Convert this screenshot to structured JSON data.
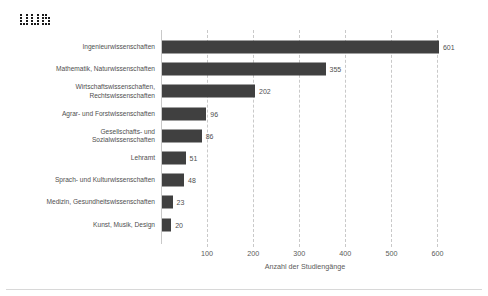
{
  "logo": {
    "name": "dot-matrix-logo",
    "alt": "uu"
  },
  "chart_data": {
    "type": "bar",
    "orientation": "horizontal",
    "title": "",
    "xlabel": "Anzahl der Studiengänge",
    "ylabel": "",
    "categories": [
      "Ingenieurwissenschaften",
      "Mathematik, Naturwissenschaften",
      "Wirtschaftswissenschaften,\nRechtswissenschaften",
      "Agrar- und Forstwissenschaften",
      "Gesellschafts- und\nSozialwissenschaften",
      "Lehramt",
      "Sprach- und Kulturwissenschaften",
      "Medizin, Gesundheitswissenschaften",
      "Kunst, Musik, Design"
    ],
    "values": [
      601,
      355,
      202,
      96,
      86,
      51,
      48,
      23,
      20
    ],
    "value_labels": [
      "601",
      "355",
      "202",
      "96",
      "86",
      "51",
      "48",
      "23",
      "20"
    ],
    "xlim": [
      0,
      625
    ],
    "xticks": [
      100,
      200,
      300,
      400,
      500,
      600
    ],
    "xticklabels": [
      "100",
      "200",
      "300",
      "400",
      "500",
      "600"
    ],
    "grid": "vertical-dashed",
    "legend": "none",
    "bar_color": "#404040",
    "grid_color": "#c9c9c9",
    "text_color": "#4f4f4f"
  }
}
